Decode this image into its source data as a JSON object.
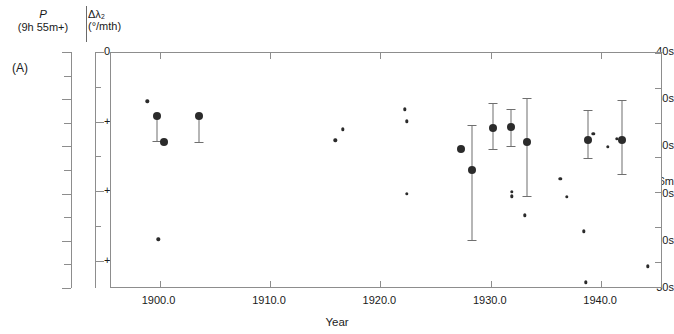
{
  "figure": {
    "panel_label": "(A)",
    "xtitle": "Year",
    "y_axis_left": {
      "title_line1": "P",
      "title_line2": "(9h 55m+)",
      "labels": [
        "40s",
        "50s",
        "60s",
        "56m",
        "10s",
        "20s",
        "30s"
      ]
    },
    "y_axis_right": {
      "title_line1": "Δλ₂",
      "title_line2": "(°/mth)",
      "labels": [
        "0",
        "+10",
        "+20",
        "+30"
      ]
    },
    "x_tick_labels": [
      "1900.0",
      "1910.0",
      "1920.0",
      "1930.0",
      "1940.0"
    ]
  },
  "chart_data": {
    "type": "scatter",
    "title": "",
    "xlabel": "Year",
    "ylabel": "P (9h 55m+)",
    "ylabel_secondary": "Δλ₂ (°/mth)",
    "xlim": [
      1895.6,
      1945.6
    ],
    "ylim_seconds": [
      40,
      90
    ],
    "ylim_secondary": [
      0,
      33.9
    ],
    "grid": false,
    "legend": "none",
    "y_ticks_seconds": [
      40,
      45,
      50,
      55,
      60,
      65,
      70,
      75,
      80,
      85,
      90
    ],
    "y_tick_labels": [
      "40s",
      "",
      "50s",
      "",
      "60s",
      "",
      "56m 10s",
      "",
      "20s",
      "",
      "30s"
    ],
    "y_ticks_secondary": [
      0,
      10,
      20,
      30
    ],
    "x_ticks": [
      1900.0,
      1910.0,
      1920.0,
      1930.0,
      1940.0
    ],
    "marker_sizes": [
      "large",
      "small"
    ],
    "points": [
      {
        "year": 1898.9,
        "p_seconds": 50.2,
        "size": "small"
      },
      {
        "year": 1899.8,
        "p_seconds": 53.4,
        "size": "large",
        "err_low": 58.7,
        "err_high": 53.4
      },
      {
        "year": 1899.9,
        "p_seconds": 79.5,
        "size": "small"
      },
      {
        "year": 1900.4,
        "p_seconds": 58.9,
        "size": "large"
      },
      {
        "year": 1903.6,
        "p_seconds": 53.4,
        "size": "large",
        "err_low": 58.8,
        "err_high": 53.4
      },
      {
        "year": 1915.9,
        "p_seconds": 58.5,
        "size": "small"
      },
      {
        "year": 1916.6,
        "p_seconds": 56.2,
        "size": "small"
      },
      {
        "year": 1922.2,
        "p_seconds": 51.9,
        "size": "small"
      },
      {
        "year": 1922.4,
        "p_seconds": 54.5,
        "size": "small"
      },
      {
        "year": 1922.4,
        "p_seconds": 69.8,
        "size": "small"
      },
      {
        "year": 1927.3,
        "p_seconds": 60.3,
        "size": "large"
      },
      {
        "year": 1928.3,
        "p_seconds": 64.8,
        "size": "large",
        "err_low": 79.7,
        "err_high": 55.2
      },
      {
        "year": 1930.2,
        "p_seconds": 55.9,
        "size": "large",
        "err_low": 60.3,
        "err_high": 50.6
      },
      {
        "year": 1931.8,
        "p_seconds": 55.6,
        "size": "large",
        "err_low": 59.6,
        "err_high": 51.8
      },
      {
        "year": 1931.9,
        "p_seconds": 69.4,
        "size": "small"
      },
      {
        "year": 1931.9,
        "p_seconds": 70.4,
        "size": "small"
      },
      {
        "year": 1933.3,
        "p_seconds": 58.8,
        "size": "large",
        "err_low": 70.2,
        "err_high": 49.6
      },
      {
        "year": 1933.1,
        "p_seconds": 74.4,
        "size": "small"
      },
      {
        "year": 1936.3,
        "p_seconds": 66.7,
        "size": "small"
      },
      {
        "year": 1936.9,
        "p_seconds": 70.5,
        "size": "small"
      },
      {
        "year": 1938.8,
        "p_seconds": 58.4,
        "size": "large",
        "err_low": 62.3,
        "err_high": 52.0
      },
      {
        "year": 1939.3,
        "p_seconds": 57.1,
        "size": "small"
      },
      {
        "year": 1938.4,
        "p_seconds": 77.8,
        "size": "small"
      },
      {
        "year": 1938.6,
        "p_seconds": 88.6,
        "size": "small"
      },
      {
        "year": 1940.6,
        "p_seconds": 59.9,
        "size": "small"
      },
      {
        "year": 1941.4,
        "p_seconds": 58.2,
        "size": "small"
      },
      {
        "year": 1941.9,
        "p_seconds": 58.5,
        "size": "large",
        "err_low": 65.6,
        "err_high": 50.0
      },
      {
        "year": 1944.2,
        "p_seconds": 85.2,
        "size": "small"
      }
    ]
  }
}
